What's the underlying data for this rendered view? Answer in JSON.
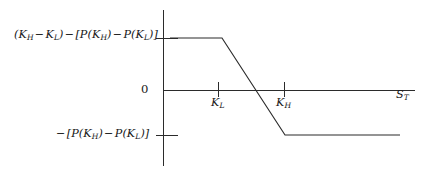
{
  "figure": {
    "kind": "payoff-diagram",
    "background": "#ffffff",
    "line_color": "#2b2b2b",
    "text_color": "#171717"
  },
  "labels": {
    "upper_value": "(K_H - K_L) - [P(K_H) - P(K_L)]",
    "lower_value": "-[P(K_H) - P(K_L)]",
    "zero": "0",
    "tick_low": "K_L",
    "tick_high": "K_H",
    "x_axis": "S_T"
  },
  "chart_data": {
    "type": "line",
    "title": "",
    "xlabel": "S_T",
    "ylabel": "",
    "grid": false,
    "legend": null,
    "xlim": [
      0,
      430
    ],
    "ylim": [
      -1,
      1
    ],
    "axes": {
      "y_axis_x": 163,
      "y_axis_top": 10,
      "y_axis_bottom": 166,
      "x_axis_y": 90,
      "x_axis_left": 163,
      "x_axis_right": 415
    },
    "y_ticks": [
      {
        "label": "(K_H - K_L) - [P(K_H) - P(K_L)]",
        "y": 38
      },
      {
        "label": "0",
        "y": 90
      },
      {
        "label": "-[P(K_H) - P(K_L)]",
        "y": 135
      }
    ],
    "x_ticks": [
      {
        "label": "K_L",
        "x": 218
      },
      {
        "label": "K_H",
        "x": 284
      }
    ],
    "series": [
      {
        "name": "payoff",
        "points": [
          {
            "x": 170,
            "y": 38
          },
          {
            "x": 222,
            "y": 38
          },
          {
            "x": 285,
            "y": 135
          },
          {
            "x": 400,
            "y": 135
          }
        ]
      }
    ]
  }
}
